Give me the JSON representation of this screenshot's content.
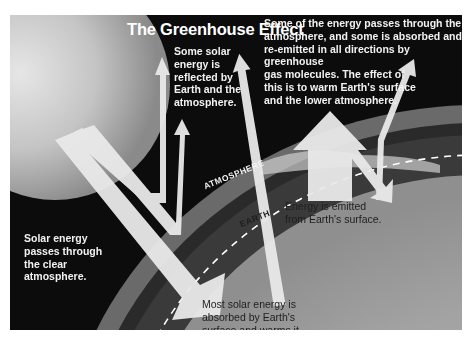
{
  "diagram": {
    "title": "The Greenhouse Effect",
    "labels": {
      "reflected": "Some solar energy is reflected by Earth and the atmosphere.",
      "reflected_lines": [
        "Some solar",
        "energy is",
        "reflected by",
        "Earth and the",
        "atmosphere."
      ],
      "greenhouse_lines": [
        "Some of the energy passes through the",
        "atmosphere, and some is absorbed and",
        "re-emitted in all directions by greenhouse",
        "gas molecules. The effect of",
        "this is to warm Earth's surface",
        "and the lower atmosphere."
      ],
      "passes_lines": [
        "Solar energy",
        "passes through",
        "the clear",
        "atmosphere."
      ],
      "emitted_lines": [
        "Energy is emitted",
        "from Earth's surface."
      ],
      "absorbed_lines": [
        "Most solar energy is",
        "absorbed by Earth's",
        "surface and warms it."
      ],
      "atmosphere": "ATMOSPHERE",
      "earth": "EARTH"
    },
    "colors": {
      "space": "#0c0c0c",
      "sun": "#d9d9d9",
      "atmosphere": "#5a5a5a",
      "earth": "#a6a6a6",
      "arrow": "#e9e9e9",
      "dashed_boundary": "#ffffff"
    }
  }
}
